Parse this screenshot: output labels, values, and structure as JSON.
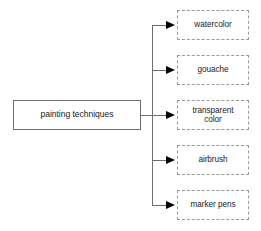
{
  "diagram": {
    "type": "tree",
    "orientation": "left-to-right",
    "background_color": "#ffffff",
    "root": {
      "label": "painting techniques",
      "border_style": "solid",
      "border_color": "#6e6e6e",
      "x": 13,
      "y": 100,
      "width": 128,
      "height": 30
    },
    "spine": {
      "x": 152,
      "y_top": 25,
      "y_bottom": 205,
      "color": "#6e6e6e"
    },
    "arrow_color": "#000000",
    "children": [
      {
        "label": "watercolor",
        "lines": [
          "watercolor"
        ],
        "border_style": "dashed",
        "border_color": "#9a9a9a",
        "x": 177,
        "y": 10,
        "width": 72,
        "height": 30,
        "arrow_y": 25
      },
      {
        "label": "gouache",
        "lines": [
          "gouache"
        ],
        "border_style": "dashed",
        "border_color": "#9a9a9a",
        "x": 177,
        "y": 55,
        "width": 72,
        "height": 30,
        "arrow_y": 70
      },
      {
        "label": "transparent color",
        "lines": [
          "transparent",
          "color"
        ],
        "border_style": "dashed",
        "border_color": "#9a9a9a",
        "x": 177,
        "y": 100,
        "width": 72,
        "height": 30,
        "arrow_y": 115
      },
      {
        "label": "airbrush",
        "lines": [
          "airbrush"
        ],
        "border_style": "dashed",
        "border_color": "#9a9a9a",
        "x": 177,
        "y": 145,
        "width": 72,
        "height": 30,
        "arrow_y": 160
      },
      {
        "label": "marker pens",
        "lines": [
          "marker pens"
        ],
        "border_style": "dashed",
        "border_color": "#9a9a9a",
        "x": 177,
        "y": 190,
        "width": 72,
        "height": 30,
        "arrow_y": 205
      }
    ]
  }
}
